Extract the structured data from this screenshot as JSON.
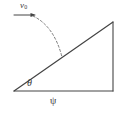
{
  "figure": {
    "background_color": "#ffffff",
    "stroke_color": "#444444",
    "dash_color": "#7a7a7a",
    "labels": {
      "initial_velocity": "v",
      "initial_velocity_subscript": "0",
      "incline_angle": "θ",
      "base_label": "ψ"
    },
    "geometry": {
      "triangle": {
        "left_vertex": [
          14,
          91
        ],
        "apex": [
          113,
          22
        ],
        "right_vertex": [
          113,
          91
        ]
      },
      "velocity_arrow": {
        "start": [
          14,
          15
        ],
        "end": [
          36,
          15
        ],
        "direction": "right"
      },
      "trajectory": {
        "type": "dashed-parabola",
        "start": [
          33,
          16
        ],
        "control": [
          52,
          27
        ],
        "end": [
          62,
          57
        ]
      }
    }
  }
}
